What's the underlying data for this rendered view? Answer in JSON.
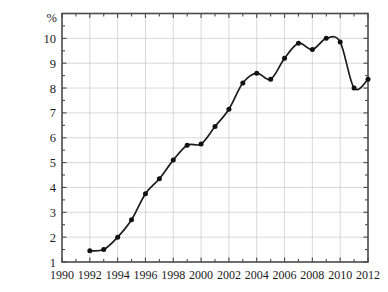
{
  "chart_data": {
    "type": "line",
    "title": "",
    "subtitle": "",
    "xlabel": "",
    "ylabel": "%",
    "y_unit_label": "%",
    "xlim": [
      1990,
      2012
    ],
    "ylim": [
      1,
      11
    ],
    "x_ticks_major": [
      1990,
      1992,
      1994,
      1996,
      1998,
      2000,
      2002,
      2004,
      2006,
      2008,
      2010,
      2012
    ],
    "x_tick_labels": [
      "1990",
      "1992",
      "1994",
      "1996",
      "1998",
      "2000",
      "2002",
      "2004",
      "2006",
      "2008",
      "2010",
      "2012"
    ],
    "x_minor_tick_step": 1,
    "y_ticks": [
      1,
      2,
      3,
      4,
      5,
      6,
      7,
      8,
      9,
      10
    ],
    "y_tick_labels": [
      "1",
      "2",
      "3",
      "4",
      "5",
      "6",
      "7",
      "8",
      "9",
      "10"
    ],
    "grid": true,
    "grid_x": true,
    "grid_y": true,
    "legend": null,
    "legend_position": "none",
    "markers": true,
    "marker_style": "filled-circle",
    "line_color": "#1c1c1c",
    "marker_color": "#111111",
    "grid_color": "#c9c9c9",
    "frame_color": "#4a4a4a",
    "background_color": "#ffffff",
    "x": [
      1992,
      1993,
      1994,
      1995,
      1996,
      1997,
      1998,
      1999,
      2000,
      2001,
      2002,
      2003,
      2004,
      2005,
      2006,
      2007,
      2008,
      2009,
      2010
    ],
    "values": [
      1.45,
      1.5,
      2.0,
      2.7,
      3.75,
      4.35,
      5.1,
      5.7,
      5.75,
      6.45,
      7.15,
      8.2,
      8.6,
      8.35,
      9.2,
      9.8,
      9.55,
      10.0,
      9.85
    ],
    "series": [
      {
        "name": "",
        "x": [
          1992,
          1993,
          1994,
          1995,
          1996,
          1997,
          1998,
          1999,
          2000,
          2001,
          2002,
          2003,
          2004,
          2005,
          2006,
          2007,
          2008,
          2009,
          2010,
          2011,
          2012
        ],
        "values": [
          1.45,
          1.5,
          2.0,
          2.7,
          3.75,
          4.35,
          5.1,
          5.7,
          5.75,
          6.45,
          7.15,
          8.2,
          8.6,
          8.35,
          9.2,
          9.8,
          9.55,
          10.0,
          9.85,
          8.0,
          8.35
        ]
      }
    ],
    "points": [
      {
        "x": 1992,
        "y": 1.45
      },
      {
        "x": 1993,
        "y": 1.5
      },
      {
        "x": 1994,
        "y": 2.0
      },
      {
        "x": 1995,
        "y": 2.7
      },
      {
        "x": 1996,
        "y": 3.75
      },
      {
        "x": 1997,
        "y": 4.35
      },
      {
        "x": 1998,
        "y": 5.1
      },
      {
        "x": 1999,
        "y": 5.7
      },
      {
        "x": 2000,
        "y": 5.75
      },
      {
        "x": 2001,
        "y": 6.45
      },
      {
        "x": 2002,
        "y": 7.15
      },
      {
        "x": 2003,
        "y": 8.2
      },
      {
        "x": 2004,
        "y": 8.6
      },
      {
        "x": 2005,
        "y": 8.35
      },
      {
        "x": 2006,
        "y": 9.2
      },
      {
        "x": 2007,
        "y": 9.8
      },
      {
        "x": 2008,
        "y": 9.55
      },
      {
        "x": 2009,
        "y": 10.0
      },
      {
        "x": 2010,
        "y": 9.85
      },
      {
        "x": 2011,
        "y": 8.0
      },
      {
        "x": 2012,
        "y": 8.35
      }
    ],
    "annotations": []
  }
}
